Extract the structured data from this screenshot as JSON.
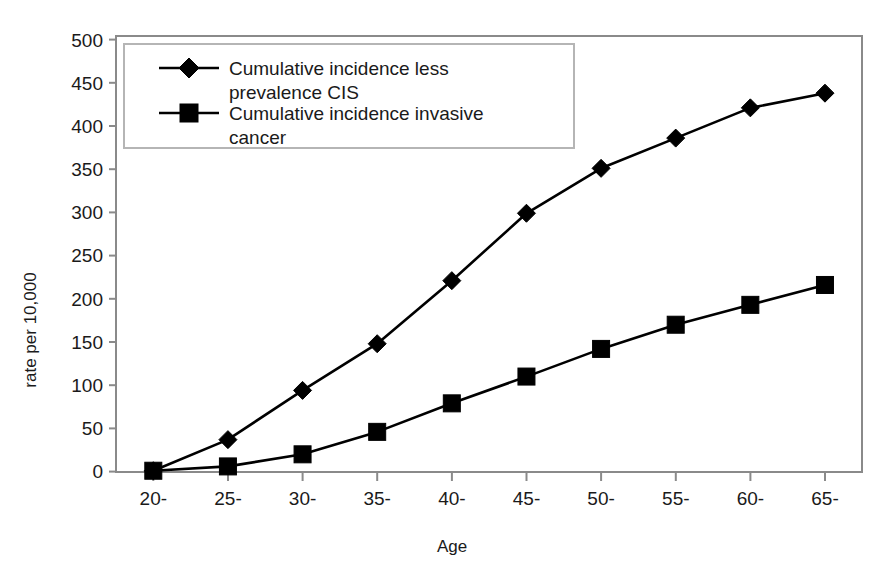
{
  "chart_data": {
    "type": "line",
    "title": "",
    "xlabel": "Age",
    "ylabel": "rate per 10,000",
    "categories": [
      "20-",
      "25-",
      "30-",
      "35-",
      "40-",
      "45-",
      "50-",
      "55-",
      "60-",
      "65-"
    ],
    "series": [
      {
        "name": "Cumulative incidence less prevalence CIS",
        "marker": "diamond",
        "values": [
          1,
          37,
          94,
          148,
          221,
          299,
          351,
          386,
          421,
          438
        ]
      },
      {
        "name": "Cumulative incidence invasive cancer",
        "marker": "square",
        "values": [
          1,
          6,
          20,
          46,
          79,
          110,
          142,
          170,
          193,
          216
        ]
      }
    ],
    "ylim": [
      0,
      500
    ],
    "ytick_step": 50,
    "yticks": [
      0,
      50,
      100,
      150,
      200,
      250,
      300,
      350,
      400,
      450,
      500
    ],
    "ytick_labels": [
      "0",
      "50",
      "100",
      "150",
      "200",
      "250",
      "300",
      "350",
      "400",
      "450",
      "500"
    ],
    "grid": false,
    "legend_position": "top-left-inside",
    "line_color": "#000000",
    "frame_color": "#8a8a8a",
    "background": "#ffffff"
  },
  "legend": {
    "entries": [
      {
        "label": "Cumulative incidence less prevalence CIS",
        "marker": "diamond-marker"
      },
      {
        "label": "Cumulative incidence invasive cancer",
        "marker": "square-marker"
      }
    ],
    "line1_part1": "Cumulative incidence less",
    "line1_part2": "prevalence CIS",
    "line2_part1": "Cumulative incidence invasive",
    "line2_part2": "cancer"
  },
  "axes": {
    "x_title": "Age",
    "y_title": "rate per 10,000"
  }
}
